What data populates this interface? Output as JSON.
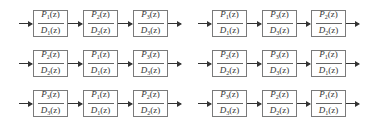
{
  "diagram": {
    "diagrams": [
      {
        "id": "top-left",
        "blocks": [
          {
            "n": "1",
            "d": "1"
          },
          {
            "n": "2",
            "d": "2"
          },
          {
            "n": "3",
            "d": "3"
          }
        ]
      },
      {
        "id": "top-right",
        "blocks": [
          {
            "n": "1",
            "d": "1"
          },
          {
            "n": "3",
            "d": "3"
          },
          {
            "n": "2",
            "d": "2"
          }
        ]
      },
      {
        "id": "middle-left",
        "blocks": [
          {
            "n": "2",
            "d": "2"
          },
          {
            "n": "1",
            "d": "1"
          },
          {
            "n": "3",
            "d": "3"
          }
        ]
      },
      {
        "id": "middle-right",
        "blocks": [
          {
            "n": "2",
            "d": "2"
          },
          {
            "n": "3",
            "d": "3"
          },
          {
            "n": "1",
            "d": "1"
          }
        ]
      },
      {
        "id": "bottom-left",
        "blocks": [
          {
            "n": "3",
            "d": "3"
          },
          {
            "n": "1",
            "d": "1"
          },
          {
            "n": "2",
            "d": "2"
          }
        ]
      },
      {
        "id": "bottom-right",
        "blocks": [
          {
            "n": "3",
            "d": "3"
          },
          {
            "n": "2",
            "d": "2"
          },
          {
            "n": "1",
            "d": "1"
          }
        ]
      }
    ],
    "numerator_symbol": "P",
    "denominator_symbol": "D",
    "argument": "(z)"
  }
}
